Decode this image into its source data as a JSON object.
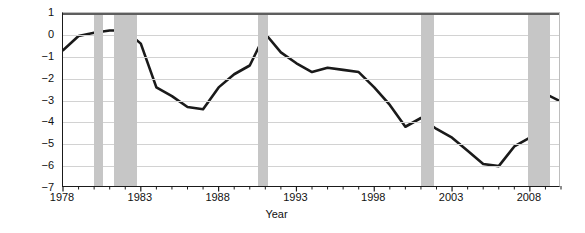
{
  "chart_data": {
    "type": "line",
    "title": "",
    "xlabel": "Year",
    "ylabel_line_1": "Current-account surplus (+)",
    "ylabel_line_2": "or deficit (−) as a share of GDP",
    "xlim": [
      1978,
      2010
    ],
    "ylim": [
      -7,
      1
    ],
    "y_ticks": [
      1,
      0,
      -1,
      -2,
      -3,
      -4,
      -5,
      -6,
      -7
    ],
    "y_tick_labels": [
      "1",
      "0",
      "−1",
      "−2",
      "−3",
      "−4",
      "−5",
      "−6",
      "−7"
    ],
    "x_ticks": [
      1978,
      1983,
      1988,
      1993,
      1998,
      2003,
      2008
    ],
    "x_tick_labels": [
      "1978",
      "1983",
      "1988",
      "1993",
      "1998",
      "2003",
      "2008"
    ],
    "x_minor_tick_interval": 1,
    "grid": "horizontal",
    "legend": null,
    "series": [
      {
        "name": "Current-account balance as a share of GDP",
        "color": "#1a1a1a",
        "line_width": 2.6,
        "x": [
          1978,
          1979,
          1980,
          1981,
          1982,
          1983,
          1984,
          1985,
          1986,
          1987,
          1988,
          1989,
          1990,
          1991,
          1992,
          1993,
          1994,
          1995,
          1996,
          1997,
          1998,
          1999,
          2000,
          2001,
          2002,
          2003,
          2004,
          2005,
          2006,
          2007,
          2008,
          2009,
          2010
        ],
        "values": [
          -0.7,
          -0.05,
          0.1,
          0.2,
          0.2,
          -0.4,
          -2.4,
          -2.8,
          -3.3,
          -3.4,
          -2.4,
          -1.8,
          -1.4,
          0.05,
          -0.8,
          -1.3,
          -1.7,
          -1.5,
          -1.6,
          -1.7,
          -2.4,
          -3.2,
          -4.2,
          -3.8,
          -4.3,
          -4.7,
          -5.3,
          -5.9,
          -6.0,
          -5.1,
          -4.7,
          -2.7,
          -3.05
        ]
      }
    ],
    "recession_bands": [
      {
        "label": "recession-1980",
        "start": 1980.0,
        "end": 1980.55
      },
      {
        "label": "recession-1981-1982",
        "start": 1981.3,
        "end": 1982.75
      },
      {
        "label": "recession-1990-1991",
        "start": 1990.5,
        "end": 1991.2
      },
      {
        "label": "recession-2001",
        "start": 2001.0,
        "end": 2001.85
      },
      {
        "label": "recession-2007-2009",
        "start": 2007.85,
        "end": 2009.3
      }
    ],
    "top_bar": {
      "name": "header-bar",
      "color": "#5e5e5e",
      "start": 1978.0,
      "end": 2010.0
    },
    "colors": {
      "line": "#1a1a1a",
      "recession_band": "#c6c6c6",
      "gridline": "#d2d2d2",
      "axis": "#1a1a1a",
      "top_bar": "#5e5e5e",
      "background": "#ffffff"
    }
  }
}
